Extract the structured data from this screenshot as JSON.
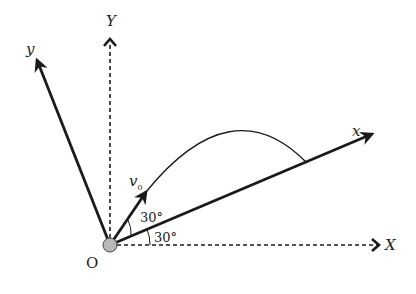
{
  "diagram": {
    "labels": {
      "Y_axis": "Y",
      "X_axis": "X",
      "y_axis": "y",
      "x_axis": "x",
      "origin": "O",
      "velocity": "v",
      "velocity_sub": "0",
      "angle_launch": "30°",
      "angle_incline": "30°"
    },
    "colors": {
      "line": "#1a1a1a",
      "origin_fill": "#b8b8b8"
    }
  }
}
